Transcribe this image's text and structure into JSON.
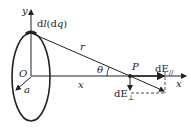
{
  "diagram": {
    "type": "physics-ring-charge-field",
    "labels": {
      "y_axis": "y",
      "x_axis": "x",
      "element": "dl(dq)",
      "element_d": "d",
      "element_l": "l",
      "element_paren": "(d",
      "element_q": "q",
      "element_close": ")",
      "distance": "r",
      "origin": "O",
      "radius": "a",
      "angle": "θ",
      "point": "P",
      "x_distance": "x",
      "dE_parallel_main": "dE",
      "dE_parallel_sub": "//",
      "dE_perp_main": "dE",
      "dE_perp_sub": "⊥"
    },
    "colors": {
      "stroke": "#222222",
      "background": "#ffffff"
    }
  }
}
